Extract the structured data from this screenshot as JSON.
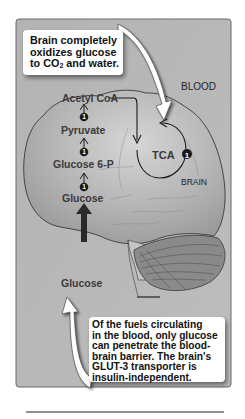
{
  "diagram": {
    "type": "metabolic-pathway-illustration",
    "background_color": "#b9b9b9",
    "frame_color": "#5a5a5a",
    "region_labels": {
      "blood": "BLOOD",
      "brain": "BRAIN"
    },
    "pathway": {
      "steps": [
        {
          "label": "Acetyl CoA"
        },
        {
          "label": "Pyruvate"
        },
        {
          "label": "Glucose 6-P"
        },
        {
          "label": "Glucose"
        }
      ],
      "step_badges": [
        "1",
        "1",
        "1"
      ],
      "cycle": {
        "label": "TCA",
        "badge": "1"
      },
      "blood_source": {
        "label": "Glucose"
      }
    },
    "callouts": {
      "top": {
        "lines": [
          "Brain completely",
          "oxidizes glucose",
          "to CO",
          "2",
          " and water."
        ]
      },
      "bottom": {
        "lines": [
          "Of the fuels circulating",
          "in the blood, only glucose",
          "can penetrate the blood-",
          "brain barrier. The brain's",
          "GLUT-3 transporter is",
          "insulin-independent."
        ]
      }
    }
  }
}
